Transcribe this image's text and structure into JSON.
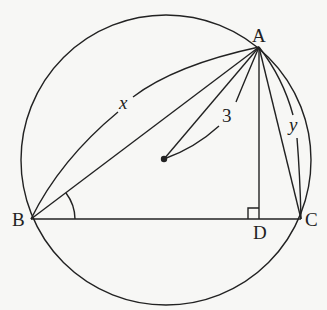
{
  "diagram": {
    "type": "geometry",
    "colors": {
      "ink": "#222222",
      "background": "#f7f7f5"
    },
    "circle": {
      "center": [
        165,
        160
      ],
      "radius": 145
    },
    "points": {
      "A": {
        "label": "A",
        "pos": [
          259,
          47
        ]
      },
      "B": {
        "label": "B",
        "pos": [
          31,
          219
        ]
      },
      "C": {
        "label": "C",
        "pos": [
          301,
          219
        ]
      },
      "D": {
        "label": "D",
        "pos": [
          259,
          219
        ]
      },
      "O": {
        "label": "",
        "pos": [
          164,
          159
        ]
      }
    },
    "segments": [
      "AB",
      "AC",
      "BC",
      "AD",
      "AO"
    ],
    "annotations": {
      "x_label": "x",
      "y_label": "y",
      "radius_label": "3",
      "x_refers_to": "AB",
      "y_refers_to": "AC",
      "radius_refers_to": "AO"
    },
    "marks": {
      "angle_at_B": "angle ABC arc",
      "right_angle_at_D": "ADB = 90°"
    }
  }
}
